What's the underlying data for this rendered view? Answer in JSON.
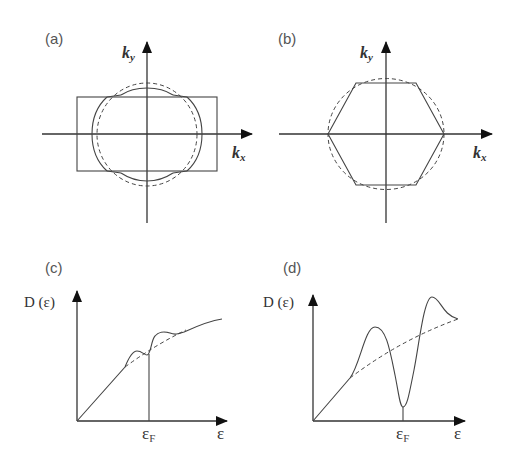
{
  "figure": {
    "panels": [
      {
        "id": "a",
        "label": "(a)",
        "type": "fermi-surface-2d",
        "x_axis_label": "k",
        "x_axis_sub": "x",
        "y_axis_label": "k",
        "y_axis_sub": "y",
        "brillouin_zone": "rectangle",
        "curves": [
          "free-electron circle (dashed)",
          "distorted Fermi surface (solid)"
        ]
      },
      {
        "id": "b",
        "label": "(b)",
        "type": "fermi-surface-2d",
        "x_axis_label": "k",
        "x_axis_sub": "x",
        "y_axis_label": "k",
        "y_axis_sub": "y",
        "brillouin_zone": "hexagon",
        "curves": [
          "free-electron circle (dashed)",
          "hexagonal Fermi surface (solid)"
        ]
      },
      {
        "id": "c",
        "label": "(c)",
        "type": "density-of-states",
        "y_axis_label": "D (ε)",
        "x_axis_label": "ε",
        "fermi_label": "ε",
        "fermi_sub": "F",
        "curves": [
          "free-electron D(ε) (dashed)",
          "D(ε) with small wiggles (solid)"
        ]
      },
      {
        "id": "d",
        "label": "(d)",
        "type": "density-of-states",
        "y_axis_label": "D (ε)",
        "x_axis_label": "ε",
        "fermi_label": "ε",
        "fermi_sub": "F",
        "curves": [
          "free-electron D(ε) (dashed)",
          "D(ε) with deep minimum at ε_F (solid)"
        ]
      }
    ]
  }
}
